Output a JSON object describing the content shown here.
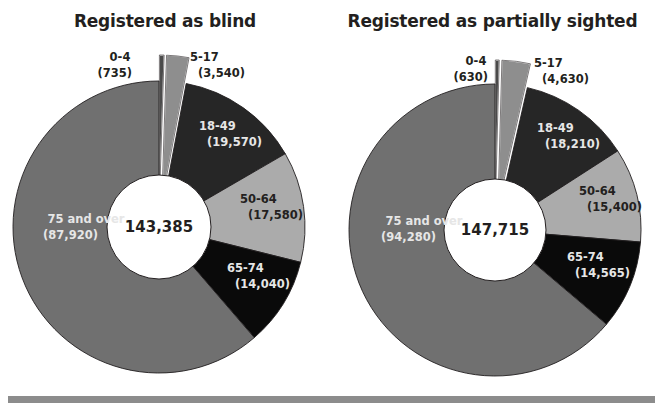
{
  "chart_data": [
    {
      "type": "pie",
      "variant": "donut",
      "title": "Registered as blind",
      "center_label": "143,385",
      "total": 143385,
      "start_angle": "12 o'clock, clockwise",
      "slices": [
        {
          "label": "0-4",
          "value": 735,
          "value_text": "(735)",
          "color": "#4a4a4a",
          "exploded": true,
          "label_color": "#231f20"
        },
        {
          "label": "5-17",
          "value": 3540,
          "value_text": "(3,540)",
          "color": "#8e8e8e",
          "exploded": true,
          "label_color": "#231f20"
        },
        {
          "label": "18-49",
          "value": 19570,
          "value_text": "(19,570)",
          "color": "#262626",
          "exploded": false,
          "label_color": "#e6e6e6"
        },
        {
          "label": "50-64",
          "value": 17580,
          "value_text": "(17,580)",
          "color": "#ababab",
          "exploded": false,
          "label_color": "#231f20"
        },
        {
          "label": "65-74",
          "value": 14040,
          "value_text": "(14,040)",
          "color": "#0a0a0a",
          "exploded": false,
          "label_color": "#e6e6e6"
        },
        {
          "label": "75 and over",
          "value": 87920,
          "value_text": "(87,920)",
          "color": "#707070",
          "exploded": false,
          "label_color": "#e6e6e6"
        }
      ]
    },
    {
      "type": "pie",
      "variant": "donut",
      "title": "Registered as partially sighted",
      "center_label": "147,715",
      "total": 147715,
      "start_angle": "12 o'clock, clockwise",
      "slices": [
        {
          "label": "0-4",
          "value": 630,
          "value_text": "(630)",
          "color": "#4a4a4a",
          "exploded": true,
          "label_color": "#231f20"
        },
        {
          "label": "5-17",
          "value": 4630,
          "value_text": "(4,630)",
          "color": "#8e8e8e",
          "exploded": true,
          "label_color": "#231f20"
        },
        {
          "label": "18-49",
          "value": 18210,
          "value_text": "(18,210)",
          "color": "#262626",
          "exploded": false,
          "label_color": "#e6e6e6"
        },
        {
          "label": "50-64",
          "value": 15400,
          "value_text": "(15,400)",
          "color": "#ababab",
          "exploded": false,
          "label_color": "#231f20"
        },
        {
          "label": "65-74",
          "value": 14565,
          "value_text": "(14,565)",
          "color": "#0a0a0a",
          "exploded": false,
          "label_color": "#e6e6e6"
        },
        {
          "label": "75 and over",
          "value": 94280,
          "value_text": "(94,280)",
          "color": "#707070",
          "exploded": false,
          "label_color": "#e6e6e6"
        }
      ]
    }
  ],
  "layout": {
    "donuts": [
      {
        "cx": 159,
        "cy": 227,
        "r_outer": 146,
        "r_inner": 52,
        "explode": 26,
        "labels": [
          {
            "x": 132,
            "y": 61,
            "anchor": "end"
          },
          {
            "x": 190,
            "y": 61,
            "anchor": "start"
          },
          {
            "x": 199,
            "y": 130,
            "anchor": "start"
          },
          {
            "x": 240,
            "y": 203,
            "anchor": "start"
          },
          {
            "x": 227,
            "y": 272,
            "anchor": "start"
          },
          {
            "x": 98,
            "y": 223,
            "anchor": "end"
          }
        ]
      },
      {
        "cx": 495,
        "cy": 230,
        "r_outer": 146,
        "r_inner": 51,
        "explode": 24,
        "labels": [
          {
            "x": 488,
            "y": 65,
            "anchor": "end"
          },
          {
            "x": 534,
            "y": 67,
            "anchor": "start"
          },
          {
            "x": 537,
            "y": 132,
            "anchor": "start"
          },
          {
            "x": 579,
            "y": 195,
            "anchor": "start"
          },
          {
            "x": 567,
            "y": 261,
            "anchor": "start"
          },
          {
            "x": 436,
            "y": 225,
            "anchor": "end"
          }
        ]
      }
    ],
    "bottom_band_color": "#8c8c8c"
  }
}
